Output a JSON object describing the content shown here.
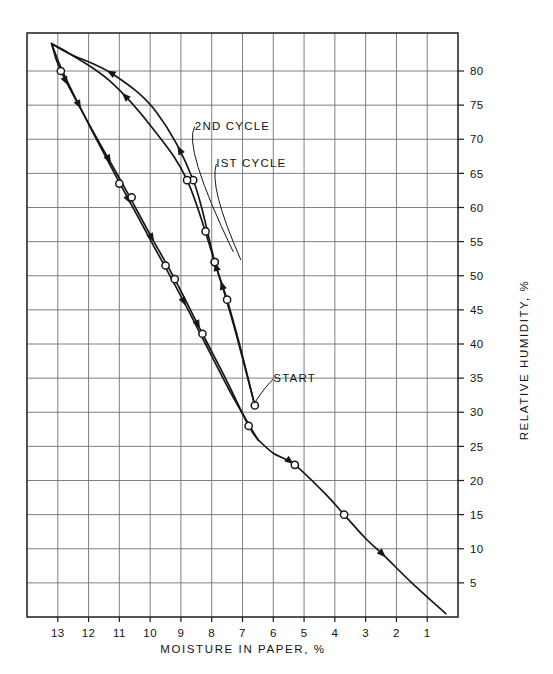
{
  "figure": {
    "background_color": "#ffffff",
    "ink_color": "#171717",
    "grid_color": "#6f7377"
  },
  "chart_data": {
    "type": "line",
    "title": "",
    "subtitle": "",
    "xlabel": "MOISTURE IN PAPER, %",
    "ylabel": "RELATIVE HUMIDITY, %",
    "xlim": [
      14,
      0
    ],
    "ylim": [
      0,
      84
    ],
    "x_axis_inverted": true,
    "grid": true,
    "legend_position": "inline-annotations",
    "xticks": [
      13,
      12,
      11,
      10,
      9,
      8,
      7,
      6,
      5,
      4,
      3,
      2,
      1
    ],
    "xticklabels": [
      "13",
      "12",
      "11",
      "10",
      "9",
      "8",
      "7",
      "6",
      "5",
      "4",
      "3",
      "2",
      "1"
    ],
    "yticks": [
      5,
      10,
      15,
      20,
      25,
      30,
      35,
      40,
      45,
      50,
      55,
      60,
      65,
      70,
      75,
      80
    ],
    "yticklabels": [
      "5",
      "10",
      "15",
      "20",
      "25",
      "30",
      "35",
      "40",
      "45",
      "50",
      "55",
      "60",
      "65",
      "70",
      "75",
      "80"
    ],
    "annotations": [
      {
        "text": "2ND CYCLE",
        "x": 8.55,
        "y": 72.0
      },
      {
        "text": "IST CYCLE",
        "x": 7.85,
        "y": 66.5
      },
      {
        "text": "START",
        "x": 6.0,
        "y": 35.0
      }
    ],
    "series": [
      {
        "name": "1st cycle adsorption (upper branch, moisture increasing)",
        "direction": "up",
        "points": [
          [
            6.6,
            31.0
          ],
          [
            7.1,
            40.0
          ],
          [
            7.5,
            46.5
          ],
          [
            7.9,
            52.0
          ],
          [
            8.6,
            64.0
          ],
          [
            9.8,
            74.0
          ],
          [
            11.2,
            79.5
          ],
          [
            12.6,
            82.5
          ],
          [
            13.2,
            84.0
          ]
        ],
        "markers": [
          [
            6.6,
            31.0
          ],
          [
            7.5,
            46.5
          ],
          [
            7.9,
            52.0
          ],
          [
            8.6,
            64.0
          ]
        ]
      },
      {
        "name": "1st cycle desorption (lower branch, moisture decreasing)",
        "direction": "down",
        "points": [
          [
            13.2,
            84.0
          ],
          [
            12.9,
            80.0
          ],
          [
            11.9,
            71.5
          ],
          [
            10.9,
            63.5
          ],
          [
            10.0,
            56.0
          ],
          [
            9.2,
            49.5
          ],
          [
            8.3,
            41.5
          ],
          [
            7.5,
            34.5
          ],
          [
            6.8,
            28.0
          ],
          [
            6.5,
            26.0
          ]
        ],
        "markers": [
          [
            12.9,
            80.0
          ],
          [
            10.6,
            61.5
          ],
          [
            9.2,
            49.5
          ],
          [
            8.3,
            41.5
          ],
          [
            6.8,
            28.0
          ]
        ]
      },
      {
        "name": "2nd cycle adsorption (moisture increasing)",
        "direction": "up",
        "points": [
          [
            6.6,
            31.0
          ],
          [
            7.3,
            43.0
          ],
          [
            7.9,
            52.0
          ],
          [
            8.8,
            64.0
          ],
          [
            9.9,
            71.5
          ],
          [
            11.3,
            78.5
          ],
          [
            12.6,
            82.5
          ],
          [
            13.2,
            84.0
          ]
        ],
        "markers": [
          [
            7.9,
            52.0
          ],
          [
            8.2,
            56.5
          ],
          [
            8.8,
            64.0
          ]
        ]
      },
      {
        "name": "2nd cycle desorption (moisture decreasing)",
        "direction": "down",
        "points": [
          [
            13.2,
            84.0
          ],
          [
            12.8,
            79.5
          ],
          [
            11.8,
            70.5
          ],
          [
            10.8,
            62.0
          ],
          [
            9.9,
            54.5
          ],
          [
            9.0,
            47.0
          ],
          [
            8.2,
            40.0
          ],
          [
            7.4,
            33.0
          ],
          [
            6.7,
            27.5
          ],
          [
            6.5,
            26.0
          ]
        ],
        "markers": [
          [
            11.0,
            63.5
          ],
          [
            9.5,
            51.5
          ]
        ]
      },
      {
        "name": "low humidity common branch",
        "direction": "down",
        "points": [
          [
            6.5,
            26.0
          ],
          [
            6.0,
            24.0
          ],
          [
            5.3,
            22.3
          ],
          [
            4.3,
            18.0
          ],
          [
            3.7,
            15.0
          ],
          [
            3.0,
            11.5
          ],
          [
            2.4,
            9.0
          ],
          [
            1.5,
            5.0
          ],
          [
            0.4,
            0.5
          ]
        ],
        "markers": [
          [
            5.3,
            22.3
          ],
          [
            3.7,
            15.0
          ]
        ]
      }
    ]
  }
}
